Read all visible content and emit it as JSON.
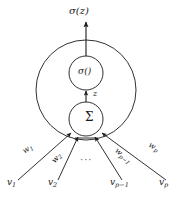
{
  "figure": {
    "output_label": "σ(z)",
    "activation_label": "σ()",
    "intermediate_label": "z",
    "summation_label": "Σ",
    "ellipsis": "···",
    "stroke_color": "#1a1a1a",
    "fill_color": "#ffffff",
    "background_color": "#ffffff"
  },
  "weights": [
    {
      "base": "w",
      "sub": "1"
    },
    {
      "base": "w",
      "sub": "2"
    },
    {
      "base": "w",
      "sub": "p−1"
    },
    {
      "base": "w",
      "sub": "p"
    }
  ],
  "inputs": [
    {
      "base": "v",
      "sub": "1"
    },
    {
      "base": "v",
      "sub": "2"
    },
    {
      "base": "v",
      "sub": "p−1"
    },
    {
      "base": "v",
      "sub": "p"
    }
  ]
}
